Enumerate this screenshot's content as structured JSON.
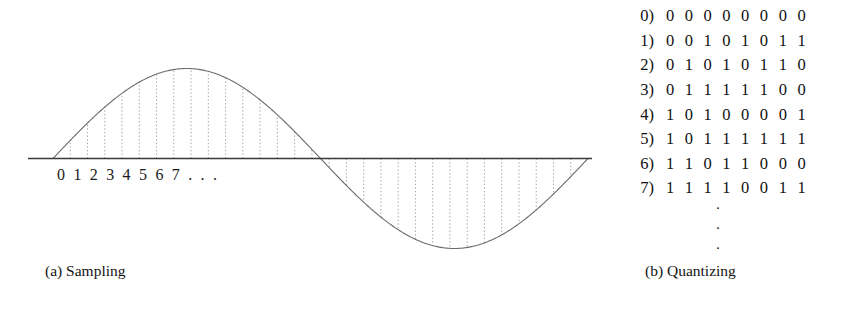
{
  "figure": {
    "background": "#ffffff",
    "ink_color": "#111111"
  },
  "panel_a": {
    "caption": "(a) Sampling",
    "tick_labels": "0 1 2 3 4 5 6 7 . . .",
    "axis_color": "#3a3a3a",
    "wave_color": "#6b6b6b",
    "sample_line_color": "#9a9a9a",
    "chart_data": {
      "type": "line",
      "title": "",
      "xlabel": "",
      "ylabel": "",
      "x": [
        0,
        1,
        2,
        3,
        4,
        5,
        6,
        7
      ],
      "waveform": "one full sine cycle, positive half then negative half",
      "amplitude": 1,
      "cycles": 1,
      "sample_count": 30,
      "xlim": [
        0,
        30
      ],
      "ylim": [
        -1,
        1
      ],
      "grid": false,
      "legend": "none"
    }
  },
  "panel_b": {
    "caption": "(b) Quantizing",
    "ellipsis_dots": [
      "·",
      "·",
      "·"
    ],
    "rows": [
      {
        "index": "0)",
        "bits": "0 0 0 0 0 0 0 0"
      },
      {
        "index": "1)",
        "bits": "0 0 1 0 1 0 1 1"
      },
      {
        "index": "2)",
        "bits": "0 1 0 1 0 1 1 0"
      },
      {
        "index": "3)",
        "bits": "0 1 1 1 1 1 0 0"
      },
      {
        "index": "4)",
        "bits": "1 0 1 0 0 0 0 1"
      },
      {
        "index": "5)",
        "bits": "1 0 1 1 1 1 1 1"
      },
      {
        "index": "6)",
        "bits": "1 1 0 1 1 0 0 0"
      },
      {
        "index": "7)",
        "bits": "1 1 1 1 0 0 1 1"
      }
    ]
  }
}
